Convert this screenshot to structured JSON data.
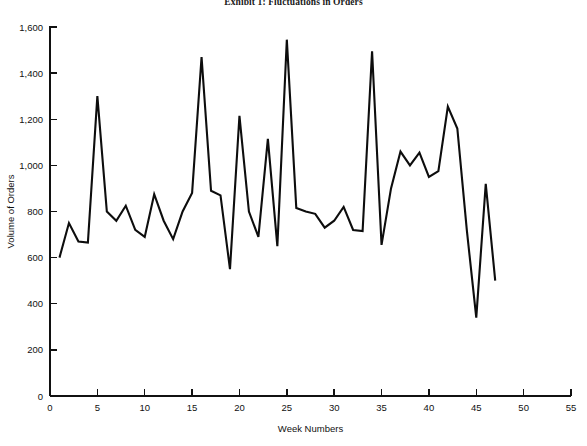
{
  "chart_data": {
    "type": "line",
    "title": "Exhibit 1: Fluctuations in Orders",
    "xlabel": "Week Numbers",
    "ylabel": "Volume of Orders",
    "xlim": [
      0,
      55
    ],
    "ylim": [
      0,
      1600
    ],
    "xticks": [
      0,
      5,
      10,
      15,
      20,
      25,
      30,
      35,
      40,
      45,
      50,
      55
    ],
    "xticklabels": [
      "0",
      "5",
      "10",
      "15",
      "20",
      "25",
      "30",
      "35",
      "40",
      "45",
      "50",
      "55"
    ],
    "yticks": [
      0,
      200,
      400,
      600,
      800,
      1000,
      1200,
      1400,
      1600
    ],
    "yticklabels": [
      "0",
      "200",
      "400",
      "600",
      "800",
      "1,000",
      "1,200",
      "1,400",
      "1,600"
    ],
    "grid": false,
    "legend": null,
    "series": [
      {
        "name": "Volume of Orders",
        "x": [
          1,
          2,
          3,
          4,
          5,
          6,
          7,
          8,
          9,
          10,
          11,
          12,
          13,
          14,
          15,
          16,
          17,
          18,
          19,
          20,
          21,
          22,
          23,
          24,
          25,
          26,
          27,
          28,
          29,
          30,
          31,
          32,
          33,
          34,
          35,
          36,
          37,
          38,
          39,
          40,
          41,
          42,
          43,
          44,
          45,
          46,
          47
        ],
        "values": [
          600,
          750,
          670,
          665,
          1300,
          800,
          760,
          825,
          720,
          690,
          875,
          760,
          680,
          800,
          880,
          1470,
          890,
          870,
          550,
          1215,
          800,
          690,
          1115,
          650,
          1545,
          815,
          800,
          790,
          730,
          760,
          820,
          720,
          715,
          1495,
          655,
          900,
          1060,
          1000,
          1055,
          950,
          975,
          1255,
          1160,
          720,
          340,
          920,
          500
        ]
      }
    ]
  }
}
